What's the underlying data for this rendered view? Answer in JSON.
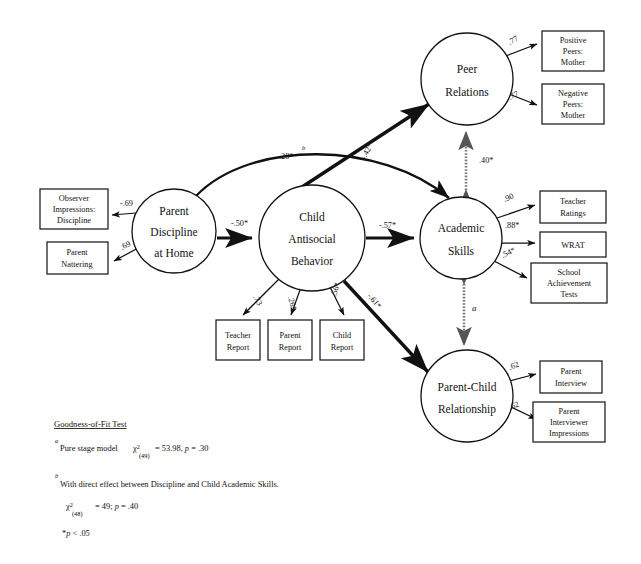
{
  "figure": {
    "type": "path-diagram",
    "latent_nodes": [
      {
        "id": "parent-discipline",
        "label_lines": [
          "Parent",
          "Discipline",
          "at Home"
        ],
        "cx": 174,
        "cy": 231,
        "r": 42
      },
      {
        "id": "child-antisocial",
        "label_lines": [
          "Child",
          "Antisocial",
          "Behavior"
        ],
        "cx": 312,
        "cy": 238,
        "r": 53
      },
      {
        "id": "peer-relations",
        "label_lines": [
          "Peer",
          "Relations"
        ],
        "cx": 467,
        "cy": 79,
        "r": 46
      },
      {
        "id": "academic-skills",
        "label_lines": [
          "Academic",
          "Skills"
        ],
        "cx": 461,
        "cy": 238,
        "r": 41
      },
      {
        "id": "parent-child",
        "label_lines": [
          "Parent-Child",
          "Relationship"
        ],
        "cx": 467,
        "cy": 396,
        "r": 46
      }
    ],
    "observed_boxes": [
      {
        "id": "observer-impressions",
        "lines": [
          "Observer",
          "Impressions:",
          "Discipline"
        ],
        "x": 40,
        "y": 189,
        "w": 68,
        "h": 40
      },
      {
        "id": "parent-nattering",
        "lines": [
          "Parent",
          "Nattering"
        ],
        "x": 47,
        "y": 242,
        "w": 61,
        "h": 32
      },
      {
        "id": "teacher-report",
        "lines": [
          "Teacher",
          "Report"
        ],
        "x": 216,
        "y": 320,
        "w": 44,
        "h": 40
      },
      {
        "id": "parent-report",
        "lines": [
          "Parent",
          "Report"
        ],
        "x": 268,
        "y": 320,
        "w": 44,
        "h": 40
      },
      {
        "id": "child-report",
        "lines": [
          "Child",
          "Report"
        ],
        "x": 320,
        "y": 320,
        "w": 44,
        "h": 40
      },
      {
        "id": "positive-peers-mother",
        "lines": [
          "Positive",
          "Peers:",
          "Mother"
        ],
        "x": 542,
        "y": 31,
        "w": 62,
        "h": 40
      },
      {
        "id": "negative-peers-mother",
        "lines": [
          "Negative",
          "Peers:",
          "Mother"
        ],
        "x": 542,
        "y": 84,
        "w": 62,
        "h": 40
      },
      {
        "id": "teacher-ratings",
        "lines": [
          "Teacher",
          "Ratings"
        ],
        "x": 540,
        "y": 191,
        "w": 66,
        "h": 32
      },
      {
        "id": "wrat",
        "lines": [
          "WRAT"
        ],
        "x": 540,
        "y": 232,
        "w": 66,
        "h": 25
      },
      {
        "id": "school-achievement-tests",
        "lines": [
          "School",
          "Achievement",
          "Tests"
        ],
        "x": 531,
        "y": 263,
        "w": 76,
        "h": 40
      },
      {
        "id": "parent-interview",
        "lines": [
          "Parent",
          "Interview"
        ],
        "x": 540,
        "y": 361,
        "w": 62,
        "h": 32
      },
      {
        "id": "parent-interviewer-impressions",
        "lines": [
          "Parent",
          "Interviewer",
          "Impressions"
        ],
        "x": 533,
        "y": 402,
        "w": 72,
        "h": 40
      }
    ],
    "structural_paths": [
      {
        "id": "discipline-to-antisocial",
        "coef": "-.50*",
        "x": 231,
        "y": 226
      },
      {
        "id": "antisocial-to-academic",
        "coef": "-.57*",
        "x": 379,
        "y": 228
      },
      {
        "id": "antisocial-to-peer",
        "coef": "-.42*",
        "x": 365,
        "y": 160,
        "rot": -62
      },
      {
        "id": "antisocial-to-parentchild",
        "coef": "-.61*",
        "x": 367,
        "y": 296,
        "rot": 50
      },
      {
        "id": "discipline-to-academic",
        "coef": ".28*",
        "sup": "b",
        "x": 279,
        "y": 159
      }
    ],
    "measurement_paths": [
      {
        "id": "discipline-observer",
        "coef": "-.69",
        "x": 120,
        "y": 206
      },
      {
        "id": "discipline-nattering",
        "coef": ".69",
        "x": 122,
        "y": 250,
        "rot": -26
      },
      {
        "id": "antisocial-teacher",
        "coef": ".73",
        "x": 253,
        "y": 297,
        "rot": 62
      },
      {
        "id": "antisocial-parent",
        "coef": ".26*",
        "x": 288,
        "y": 297,
        "rot": 75
      },
      {
        "id": "antisocial-child",
        "coef": ".56*",
        "x": 336,
        "y": 297,
        "rot": -74
      },
      {
        "id": "peer-positive",
        "coef": ".77",
        "x": 510,
        "y": 45,
        "rot": -30
      },
      {
        "id": "peer-negative",
        "coef": ".77",
        "x": 510,
        "y": 100,
        "rot": -26
      },
      {
        "id": "academic-teacher-ratings",
        "coef": ".90",
        "x": 505,
        "y": 202,
        "rot": -24
      },
      {
        "id": "academic-wrat",
        "coef": ".88*",
        "x": 505,
        "y": 228
      },
      {
        "id": "academic-school-tests",
        "coef": ".54*",
        "x": 503,
        "y": 258,
        "rot": -26
      },
      {
        "id": "parentchild-interview",
        "coef": ".62",
        "x": 510,
        "y": 370,
        "rot": -22
      },
      {
        "id": "parentchild-impressions",
        "coef": ".62",
        "x": 510,
        "y": 410,
        "rot": -22
      }
    ],
    "correlations": [
      {
        "id": "peer-academic-correlation",
        "coef": ".40*",
        "x": 479,
        "y": 163
      },
      {
        "id": "academic-parentchild-correlation",
        "coef": "a",
        "x": 472,
        "y": 311,
        "italic": true
      }
    ],
    "footnotes": {
      "title": "Goodness-of-Fit Test",
      "note_a_marker": "a",
      "note_a_text": "Pure stage model",
      "note_a_chi": "2",
      "note_a_df": "(49)",
      "note_a_stats": "= 53.98, p = .30",
      "note_b_marker": "b",
      "note_b_text": "With direct effect between Discipline and Child Academic Skills.",
      "note_b_chi": "2",
      "note_b_df": "(48)",
      "note_b_stats": "= 49;  p = .40",
      "significance": "*p < .05"
    }
  }
}
